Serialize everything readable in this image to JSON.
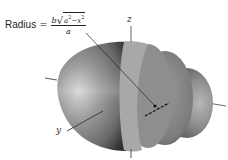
{
  "figure": {
    "formula": {
      "lhs": "Radius",
      "equals": "=",
      "numerator_coeff": "b",
      "radicand_a": "a",
      "radicand_x": "x",
      "exponent": "2",
      "minus": "−",
      "denominator": "a"
    },
    "axes": {
      "z_label": "z",
      "y_label": "y"
    },
    "colors": {
      "body_dark": "#3c3c3c",
      "body_mid": "#7a7a7a",
      "body_light": "#c8c8c8",
      "band": "#a3a3a3",
      "cap": "#8c8c8c",
      "line": "#222222"
    }
  }
}
